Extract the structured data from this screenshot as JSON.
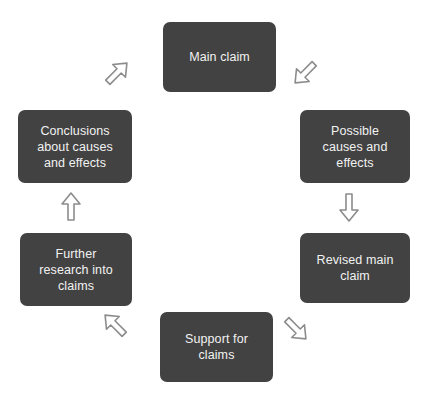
{
  "diagram": {
    "type": "cycle",
    "direction": "clockwise",
    "background_color": "#ffffff",
    "node_fill_color": "#424242",
    "node_text_color": "#f2f2f2",
    "arrow_color": "#8c8c8c",
    "nodes": [
      {
        "id": "main-claim",
        "label": "Main claim",
        "position": "top"
      },
      {
        "id": "possible-causes-effects",
        "label": "Possible\ncauses and\neffects",
        "position": "right-upper"
      },
      {
        "id": "revised-main-claim",
        "label": "Revised main\nclaim",
        "position": "right-lower"
      },
      {
        "id": "support-for-claims",
        "label": "Support for\nclaims",
        "position": "bottom"
      },
      {
        "id": "further-research",
        "label": "Further\nresearch into\nclaims",
        "position": "left-lower"
      },
      {
        "id": "conclusions",
        "label": "Conclusions\nabout causes\nand effects",
        "position": "left-upper"
      }
    ],
    "arrows": [
      {
        "id": "arrow-main-to-possible",
        "from": "main-claim",
        "to": "possible-causes-effects",
        "direction": "down-right"
      },
      {
        "id": "arrow-possible-to-revised",
        "from": "possible-causes-effects",
        "to": "revised-main-claim",
        "direction": "down"
      },
      {
        "id": "arrow-revised-to-support",
        "from": "revised-main-claim",
        "to": "support-for-claims",
        "direction": "down-left"
      },
      {
        "id": "arrow-support-to-research",
        "from": "support-for-claims",
        "to": "further-research",
        "direction": "up-left"
      },
      {
        "id": "arrow-research-to-conclusions",
        "from": "further-research",
        "to": "conclusions",
        "direction": "up"
      },
      {
        "id": "arrow-conclusions-to-main",
        "from": "conclusions",
        "to": "main-claim",
        "direction": "up-right"
      }
    ]
  }
}
